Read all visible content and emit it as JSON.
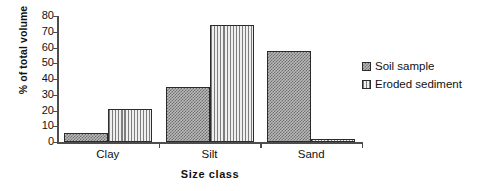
{
  "chart_data": {
    "type": "bar",
    "title": "",
    "subtitle": "",
    "xlabel": "Size class",
    "ylabel": "% of total volume",
    "categories": [
      "Clay",
      "Silt",
      "Sand"
    ],
    "series": [
      {
        "name": "Soil sample",
        "values": [
          6,
          35,
          58
        ],
        "pattern": "checkered",
        "color": "#b9b9b9"
      },
      {
        "name": "Eroded sediment",
        "values": [
          21,
          74,
          2
        ],
        "pattern": "vertical-stripes",
        "color": "#e2e2e2"
      }
    ],
    "ylim": [
      0,
      80
    ],
    "ytick_values": [
      0,
      10,
      20,
      30,
      40,
      50,
      60,
      70,
      80
    ],
    "ytick_labels": [
      "0",
      "10",
      "20",
      "30",
      "40",
      "50",
      "60",
      "70",
      "80"
    ],
    "grid": false,
    "legend_position": "right",
    "axis_color": "#4d4d4d",
    "bar_edge_color": "#2b2b2b"
  },
  "axes": {
    "y_title": "% of total volume",
    "x_title": "Size class"
  },
  "legend": {
    "items": [
      {
        "label": "Soil sample"
      },
      {
        "label": "Eroded sediment"
      }
    ]
  }
}
